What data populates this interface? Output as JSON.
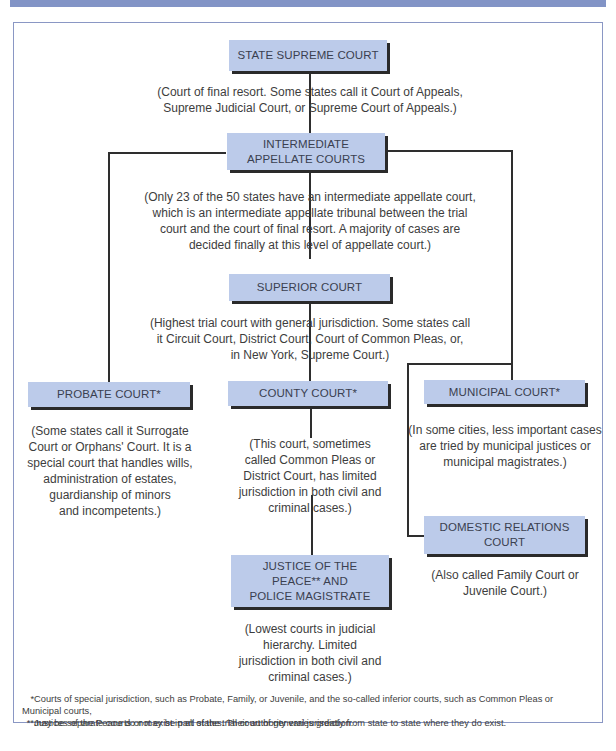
{
  "title_bar": {
    "color": "#8294c6"
  },
  "colors": {
    "box_fill": "#bccbea",
    "box_shadow": "#2a2a2a",
    "line": "#2e2e2e",
    "frame_border": "#8a97c4"
  },
  "nodes": {
    "state_supreme": {
      "label": "STATE SUPREME COURT",
      "description": [
        "(Court of final resort. Some states call it Court of Appeals,",
        "Supreme Judicial Court, or Supreme Court of Appeals.)"
      ]
    },
    "intermediate_appellate": {
      "label": [
        "INTERMEDIATE",
        "APPELLATE COURTS"
      ],
      "description": [
        "(Only 23 of the 50 states have an intermediate appellate court,",
        "which is an intermediate appellate tribunal between the trial",
        "court and the court of final resort. A majority of cases are",
        "decided finally at this level of appellate court.)"
      ]
    },
    "superior": {
      "label": "SUPERIOR COURT",
      "description": [
        "(Highest trial court with general jurisdiction. Some states call",
        "it Circuit Court, District Court, Court of Common Pleas, or,",
        "in New York, Supreme Court.)"
      ]
    },
    "probate": {
      "label": "PROBATE COURT*",
      "description": [
        "(Some states call it Surrogate",
        "Court or Orphans' Court. It is a",
        "special court that handles wills,",
        "administration of estates,",
        "guardianship of minors",
        "and incompetents.)"
      ]
    },
    "county": {
      "label": "COUNTY COURT*",
      "description": [
        "(This court, sometimes",
        "called Common Pleas or",
        "District Court, has limited",
        "jurisdiction in both civil and",
        "criminal cases.)"
      ]
    },
    "municipal": {
      "label": "MUNICIPAL COURT*",
      "description": [
        "(In some cities, less important cases",
        "are tried by municipal justices or",
        "municipal magistrates.)"
      ]
    },
    "domestic_relations": {
      "label": [
        "DOMESTIC RELATIONS",
        "COURT"
      ],
      "description": [
        "(Also called Family Court or",
        "Juvenile Court.)"
      ]
    },
    "justice_peace": {
      "label": [
        "JUSTICE OF THE",
        "PEACE** AND",
        "POLICE MAGISTRATE"
      ],
      "description": [
        "(Lowest courts in judicial",
        "hierarchy. Limited",
        "jurisdiction in both civil and",
        "criminal cases.)"
      ]
    }
  },
  "footnotes": [
    {
      "marker": "*",
      "lines": [
        "Courts of special jurisdiction, such as Probate, Family, or Juvenile, and the so-called inferior courts, such as Common Pleas or Municipal courts,",
        "may be separate courts or may be part of the trial court of general jurisdiction."
      ]
    },
    {
      "marker": "**",
      "lines": [
        "Justices of the Peace do not exist in all states. Their authority varies greatly from state to state where they do exist."
      ]
    }
  ]
}
